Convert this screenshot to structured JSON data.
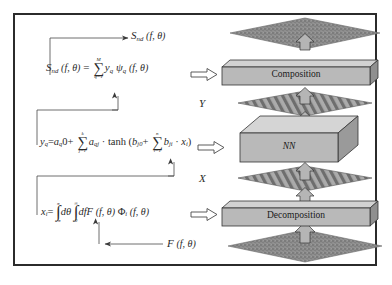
{
  "figure": {
    "border_color": "#2b2b2b",
    "background": "#ffffff"
  },
  "equations": {
    "composition": {
      "id": "eq-composition",
      "lhs_symbol": "S",
      "lhs_subscript": "nd",
      "lhs_args": "(f,  θ)",
      "equals": "=",
      "sum_upper": "M",
      "sum_symbol": "∑",
      "sum_lower": "q=1",
      "term_a_symbol": "y",
      "term_a_subscript": "q",
      "term_b_symbol": "ψ",
      "term_b_subscript": "q",
      "term_args": "(f,  θ)",
      "plain": "S_nd (f, θ) = Σ_{q=1}^{M} y_q ψ_q (f, θ)"
    },
    "network": {
      "id": "eq-network",
      "lhs_symbol": "y",
      "lhs_subscript": "q",
      "equals": "=",
      "bias_symbol": "a",
      "bias_subscript": "q",
      "bias_index": "0",
      "plus": "+",
      "sum_upper": "k",
      "sum_symbol": "∑",
      "sum_lower": "j=1",
      "weight_symbol": "a",
      "weight_subscript": "qj",
      "dot": "·",
      "activation": "tanh",
      "open_paren": "(",
      "inner_bias_symbol": "b",
      "inner_bias_subscript": "j0",
      "inner_plus": "+",
      "inner_sum_upper": "n",
      "inner_sum_symbol": "∑",
      "inner_sum_lower": "i=1",
      "inner_weight_symbol": "b",
      "inner_weight_subscript": "ji",
      "inner_dot": "·",
      "input_symbol": "x",
      "input_subscript": "i",
      "close_paren": ")",
      "plain": "y_q = a_q0 + Σ_{j=1}^{k} a_qj · tanh ( b_j0 + Σ_{i=1}^{n} b_ji · x_i )"
    },
    "decomposition": {
      "id": "eq-decomposition",
      "lhs_symbol": "x",
      "lhs_subscript": "i",
      "equals": "=",
      "int1_upper": "π",
      "int_symbol": "∫",
      "int1_lower": "-π",
      "dtheta": "dθ",
      "int2_upper": "∞",
      "int2_lower": "0",
      "df": "df",
      "spec_symbol": "F",
      "spec_args": "(f,  θ)",
      "basis_symbol": "Φ",
      "basis_subscript": "i",
      "basis_args": "(f,  θ)",
      "plain": "x_i = ∫_{-π}^{π} dθ ∫_{0}^{∞} df F (f, θ) Φ_i (f, θ)"
    }
  },
  "labels": {
    "top_output": {
      "symbol": "S",
      "subscript": "nd",
      "args": "(f,  θ)",
      "plain": "S_nd (f, θ)"
    },
    "bottom_input": {
      "symbol": "F",
      "args": "(f,  θ)",
      "plain": "F (f, θ)"
    },
    "y_plane": "Y",
    "x_plane": "X"
  },
  "blocks": [
    {
      "id": "composition-block",
      "label": "Composition",
      "face_color": "#b9b9b9",
      "top_color": "#d2d2d2",
      "side_color": "#8f8f8f"
    },
    {
      "id": "nn-block",
      "label": "NN",
      "italic": true,
      "face_color": "#b9b9b9",
      "top_color": "#d5d5d5",
      "side_color": "#9a9a9a"
    },
    {
      "id": "decomposition-block",
      "label": "Decomposition",
      "face_color": "#b9b9b9",
      "top_color": "#d2d2d2",
      "side_color": "#8f8f8f"
    }
  ],
  "planes": [
    {
      "id": "sea-surface-top",
      "style": "speckled",
      "color": "#8a8a8a"
    },
    {
      "id": "y-vector-plane",
      "style": "hatched",
      "color": "#9c9c9c"
    },
    {
      "id": "x-vector-plane",
      "style": "hatched",
      "color": "#9c9c9c"
    },
    {
      "id": "sea-surface-bottom",
      "style": "speckled",
      "color": "#8a8a8a"
    }
  ],
  "flow_arrows": {
    "direction": "upward",
    "count": 5,
    "style": "hollow-block",
    "pointer_style": "hollow-right"
  },
  "colors": {
    "ink": "#2a2a2a",
    "slab_face": "#b9b9b9",
    "slab_top": "#d2d2d2",
    "slab_side": "#8f8f8f",
    "plane_grey": "#9c9c9c",
    "speckle_grey": "#8a8a8a",
    "border": "#2b2b2b"
  }
}
